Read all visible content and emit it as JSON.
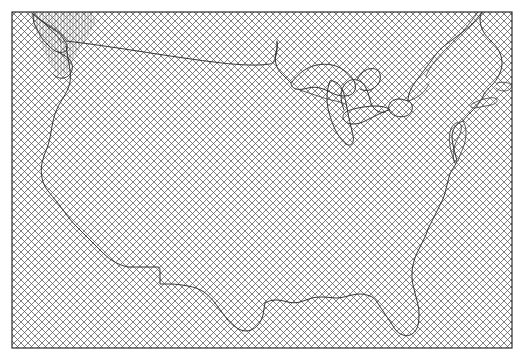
{
  "figure": {
    "title": "",
    "width": 524,
    "height": 361,
    "background_color": "#ffffff"
  },
  "map": {
    "name": "contiguous-united-states",
    "projection_look": "conic",
    "plot_area": {
      "left": 12,
      "top": 12,
      "right": 512,
      "bottom": 348,
      "width": 500,
      "height": 336
    },
    "frame": {
      "visible": true,
      "stroke_color": "#1a1a1a",
      "stroke_width": 1.1
    },
    "fill": {
      "pattern": "crosshatch",
      "description": "diagonal cross-hatch lines in both directions covering the entire map frame",
      "line_color": "#555555",
      "line_width": 0.7,
      "spacing_px": 7,
      "angle_degrees": 45
    },
    "overlay_region": {
      "name": "pacific-northwest-dense-hatch",
      "pattern": "vertical-hatch",
      "line_color": "#666666",
      "line_width": 0.55,
      "spacing_px": 3,
      "visible": true
    },
    "outline": {
      "stroke_color": "#2b2b2b",
      "stroke_width": 0.95,
      "features": [
        "pacific-coastline",
        "canada-border-49th-parallel",
        "great-lakes",
        "atlantic-coastline",
        "gulf-coastline",
        "mexico-border",
        "saint-lawrence-river"
      ]
    },
    "axes": {
      "ticks_visible": false,
      "tick_labels_visible": false,
      "grid_visible": false,
      "xlabel": "",
      "ylabel": ""
    },
    "legend": {
      "visible": false,
      "entries": []
    },
    "annotations": []
  }
}
